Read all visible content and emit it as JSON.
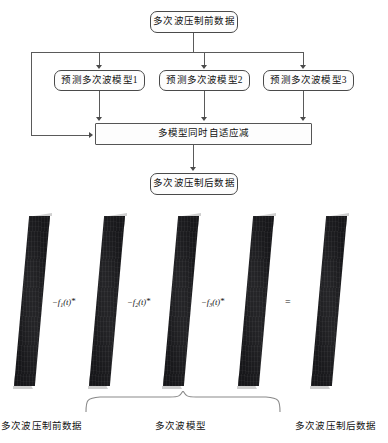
{
  "figure": {
    "flowchart": {
      "input_box": {
        "label": "多次波压制前数据"
      },
      "model_boxes": [
        {
          "label": "预测多次波模型1"
        },
        {
          "label": "预测多次波模型2"
        },
        {
          "label": "预测多次波模型3"
        }
      ],
      "combine_box": {
        "label": "多模型同时自适应减"
      },
      "output_box": {
        "label": "多次波压制后数据"
      }
    },
    "equation_row": {
      "panels": [
        {
          "name": "input-gather"
        },
        {
          "name": "multiple-model-1"
        },
        {
          "name": "multiple-model-2"
        },
        {
          "name": "multiple-model-3"
        },
        {
          "name": "output-gather"
        }
      ],
      "operators": [
        {
          "minus": "−",
          "func": "f",
          "index": "1",
          "arg": "(t)",
          "conv": "*"
        },
        {
          "minus": "−",
          "func": "f",
          "index": "2",
          "arg": "(t)",
          "conv": "*"
        },
        {
          "minus": "−",
          "func": "f",
          "index": "3",
          "arg": "(t)",
          "conv": "*"
        }
      ],
      "equals": "=",
      "captions": {
        "left": "多次波压制前数据",
        "center": "多次波模型",
        "right": "多次波压制后数据"
      }
    },
    "colors": {
      "panel_fill": "#17171a",
      "box_border": "#4a4a4a",
      "connector": "#5a5a5a",
      "background": "#ffffff"
    }
  }
}
